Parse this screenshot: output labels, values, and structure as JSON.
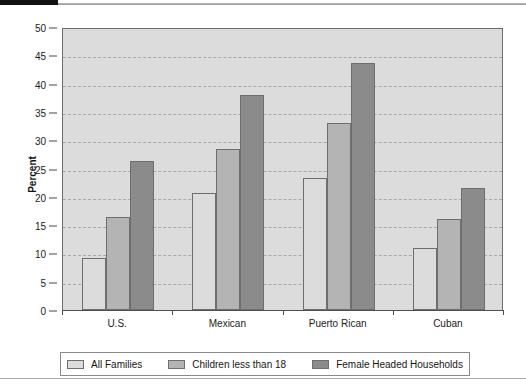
{
  "chart_data": {
    "type": "bar",
    "title": "",
    "xlabel": "",
    "ylabel": "Percent",
    "ylim": [
      0,
      50
    ],
    "yticks": [
      0,
      5,
      10,
      15,
      20,
      25,
      30,
      35,
      40,
      45,
      50
    ],
    "ytick_labels": [
      "0",
      "5",
      "10",
      "15",
      "20",
      "25",
      "30",
      "35",
      "40",
      "45",
      "50"
    ],
    "grid": true,
    "grid_style": "dashed-horizontal",
    "legend_position": "bottom",
    "categories": [
      "U.S.",
      "Mexican",
      "Puerto Rican",
      "Cuban"
    ],
    "series": [
      {
        "name": "All Families",
        "color": "#dcdcdc",
        "values": [
          9.2,
          20.6,
          23.4,
          11.0
        ]
      },
      {
        "name": "Children less than 18",
        "color": "#b4b4b4",
        "values": [
          16.5,
          28.4,
          33.0,
          16.0
        ]
      },
      {
        "name": "Female Headed Households",
        "color": "#8b8b8b",
        "values": [
          26.4,
          38.0,
          43.7,
          21.5
        ]
      }
    ]
  },
  "legend": {
    "items": [
      {
        "label": "All Families",
        "color": "#dcdcdc"
      },
      {
        "label": "Children less than 18",
        "color": "#b4b4b4"
      },
      {
        "label": "Female Headed Households",
        "color": "#8b8b8b"
      }
    ]
  },
  "colors": {
    "plot_background": "#dcdcdc",
    "axis": "#4f4f4f",
    "gridline": "#a9a9a9",
    "accent_black_bar": "#121212"
  }
}
